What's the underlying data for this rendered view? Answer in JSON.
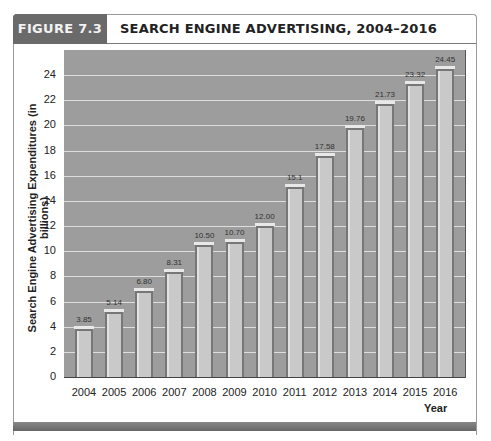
{
  "figure": {
    "label": "FIGURE 7.3",
    "title": "SEARCH ENGINE ADVERTISING, 2004–2016"
  },
  "chart_data": {
    "type": "bar",
    "title": "SEARCH ENGINE ADVERTISING, 2004–2016",
    "xlabel": "Year",
    "ylabel": "Search Engine Advertising Expenditures (in billions)",
    "categories": [
      "2004",
      "2005",
      "2006",
      "2007",
      "2008",
      "2009",
      "2010",
      "2011",
      "2012",
      "2013",
      "2014",
      "2015",
      "2016"
    ],
    "values": [
      3.85,
      5.14,
      6.8,
      8.31,
      10.5,
      10.7,
      12.0,
      15.1,
      17.58,
      19.76,
      21.73,
      23.32,
      24.45
    ],
    "value_labels": [
      "3.85",
      "5.14",
      "6.80",
      "8.31",
      "10.50",
      "10.70",
      "12.00",
      "15.1",
      "17.58",
      "19.76",
      "21.73",
      "23.32",
      "24.45"
    ],
    "yticks": [
      "0",
      "2",
      "4",
      "6",
      "8",
      "10",
      "12",
      "14",
      "16",
      "18",
      "20",
      "22",
      "24"
    ],
    "ylim": [
      0,
      26
    ],
    "grid": true,
    "colors": {
      "plot_bg": "#9d9d9d",
      "bar": "#c9c9c9",
      "grid": "#dedede",
      "label_box": "#6a6a6a"
    }
  }
}
